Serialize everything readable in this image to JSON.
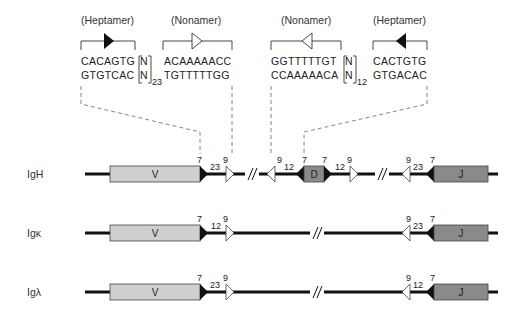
{
  "top_panel": {
    "motifs": [
      {
        "title": "(Heptamer)",
        "strand1": "CACAGTG",
        "strand2": "GTGTCAC",
        "arrow": "filled-right"
      },
      {
        "title": "(Nonamer)",
        "strand1": "ACAAAAACC",
        "strand2": "TGTTTTTGG",
        "arrow": "open-right"
      },
      {
        "title": "(Nonamer)",
        "strand1": "GGTTTTTGT",
        "strand2": "CCAAAAACA",
        "arrow": "open-left"
      },
      {
        "title": "(Heptamer)",
        "strand1": "CACTGTG",
        "strand2": "GTGACAC",
        "arrow": "filled-left"
      }
    ],
    "spacers": [
      {
        "top": "N",
        "bottom": "N",
        "subscript": "23"
      },
      {
        "top": "N",
        "bottom": "N",
        "subscript": "12"
      }
    ]
  },
  "loci": [
    {
      "name": "IgH",
      "segments": [
        {
          "label": "V"
        },
        {
          "label": "D"
        },
        {
          "label": "J"
        }
      ],
      "rss_labels": {
        "v_hept": "7",
        "v_spacer": "23",
        "v_non": "9",
        "d5_non": "9",
        "d5_spacer": "12",
        "d5_hept": "7",
        "d3_hept": "7",
        "d3_spacer": "12",
        "d3_non": "9",
        "j_non": "9",
        "j_spacer": "23",
        "j_hept": "7"
      }
    },
    {
      "name": "Igκ",
      "segments": [
        {
          "label": "V"
        },
        {
          "label": "J"
        }
      ],
      "rss_labels": {
        "v_hept": "7",
        "v_spacer": "12",
        "v_non": "9",
        "j_non": "9",
        "j_spacer": "23",
        "j_hept": "7"
      }
    },
    {
      "name": "Igλ",
      "segments": [
        {
          "label": "V"
        },
        {
          "label": "J"
        }
      ],
      "rss_labels": {
        "v_hept": "7",
        "v_spacer": "23",
        "v_non": "9",
        "j_non": "9",
        "j_spacer": "12",
        "j_hept": "7"
      }
    }
  ],
  "colors": {
    "v_segment": "#cfcfcf",
    "d_segment": "#8a8a8a",
    "j_segment": "#8a8a8a",
    "chromosome_line": "#111111",
    "heptamer": "#111111",
    "nonamer": "#ffffff"
  }
}
